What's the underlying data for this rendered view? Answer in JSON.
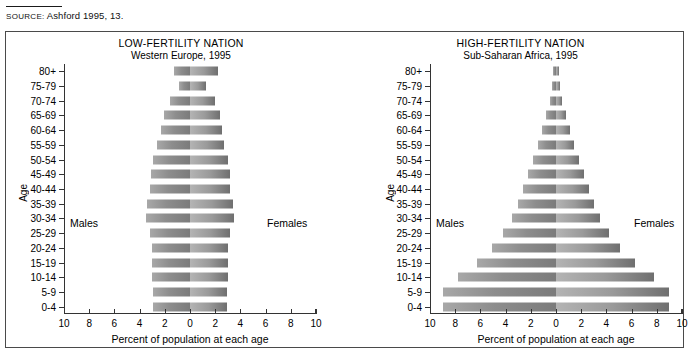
{
  "source": {
    "label": "SOURCE:",
    "text": "Ashford 1995, 13."
  },
  "charts": [
    {
      "id": "low-fertility",
      "title_line1": "LOW-FERTILITY NATION",
      "title_line2": "Western Europe, 1995",
      "axis_label_y": "Age",
      "axis_label_x": "Percent of population at each age",
      "label_males": "Males",
      "label_females": "Females"
    },
    {
      "id": "high-fertility",
      "title_line1": "HIGH-FERTILITY NATION",
      "title_line2": "Sub-Saharan Africa, 1995",
      "axis_label_y": "Age",
      "axis_label_x": "Percent of population at each age",
      "label_males": "Males",
      "label_females": "Females"
    }
  ],
  "chart_data": [
    {
      "type": "bar",
      "subtype": "population-pyramid",
      "title": "LOW-FERTILITY NATION",
      "subtitle": "Western Europe, 1995",
      "xlabel": "Percent of population at each age",
      "ylabel": "Age",
      "xlim": [
        -10,
        10
      ],
      "xticks": [
        10,
        8,
        6,
        4,
        2,
        0,
        2,
        4,
        6,
        8,
        10
      ],
      "grid": false,
      "legend": [
        "Males",
        "Females"
      ],
      "legend_position": "inline-left-right",
      "categories": [
        "80+",
        "75-79",
        "70-74",
        "65-69",
        "60-64",
        "55-59",
        "50-54",
        "45-49",
        "40-44",
        "35-39",
        "30-34",
        "25-29",
        "20-24",
        "15-19",
        "10-14",
        "5-9",
        "0-4"
      ],
      "series": [
        {
          "name": "Males",
          "values": [
            1.3,
            0.9,
            1.6,
            2.1,
            2.3,
            2.6,
            2.9,
            3.1,
            3.2,
            3.4,
            3.5,
            3.2,
            3.0,
            3.0,
            3.0,
            2.9,
            2.9
          ]
        },
        {
          "name": "Females",
          "values": [
            2.2,
            1.3,
            2.0,
            2.4,
            2.5,
            2.7,
            3.0,
            3.2,
            3.2,
            3.4,
            3.5,
            3.2,
            3.0,
            3.0,
            3.0,
            2.9,
            2.9
          ]
        }
      ]
    },
    {
      "type": "bar",
      "subtype": "population-pyramid",
      "title": "HIGH-FERTILITY NATION",
      "subtitle": "Sub-Saharan Africa, 1995",
      "xlabel": "Percent of population at each age",
      "ylabel": "Age",
      "xlim": [
        -10,
        10
      ],
      "xticks": [
        10,
        8,
        6,
        4,
        2,
        0,
        2,
        4,
        6,
        8,
        10
      ],
      "grid": false,
      "legend": [
        "Males",
        "Females"
      ],
      "legend_position": "inline-left-right",
      "categories": [
        "80+",
        "75-79",
        "70-74",
        "65-69",
        "60-64",
        "55-59",
        "50-54",
        "45-49",
        "40-44",
        "35-39",
        "30-34",
        "25-29",
        "20-24",
        "15-19",
        "10-14",
        "5-9",
        "0-4"
      ],
      "series": [
        {
          "name": "Males",
          "values": [
            0.2,
            0.3,
            0.5,
            0.8,
            1.1,
            1.4,
            1.8,
            2.2,
            2.6,
            3.0,
            3.5,
            4.2,
            5.1,
            6.3,
            7.8,
            9.0,
            9.0
          ]
        },
        {
          "name": "Females",
          "values": [
            0.2,
            0.3,
            0.5,
            0.8,
            1.1,
            1.4,
            1.8,
            2.2,
            2.6,
            3.0,
            3.5,
            4.2,
            5.1,
            6.3,
            7.8,
            9.0,
            9.0
          ]
        }
      ]
    }
  ],
  "colors": {
    "bar_light": "#b4b4b4",
    "bar_dark": "#6f6f6f",
    "frame": "#4a4a4a",
    "axis": "#333333",
    "text": "#000000"
  }
}
